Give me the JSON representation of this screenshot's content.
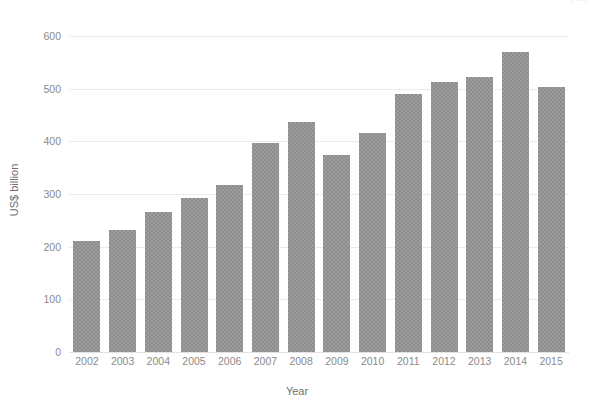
{
  "top_clipped_text": "(%)",
  "chart_data": {
    "type": "bar",
    "title": "",
    "subtitle": "",
    "xlabel": "Year",
    "ylabel": "US$ billion",
    "categories": [
      "2002",
      "2003",
      "2004",
      "2005",
      "2006",
      "2007",
      "2008",
      "2009",
      "2010",
      "2011",
      "2012",
      "2013",
      "2014",
      "2015"
    ],
    "values": [
      210,
      232,
      265,
      293,
      317,
      397,
      436,
      374,
      416,
      489,
      512,
      523,
      570,
      503
    ],
    "series": [
      {
        "name": "US$ billion",
        "values": [
          210,
          232,
          265,
          293,
          317,
          397,
          436,
          374,
          416,
          489,
          512,
          523,
          570,
          503
        ]
      }
    ],
    "ylim": [
      0,
      615
    ],
    "yticks": [
      0,
      100,
      200,
      300,
      400,
      500,
      600
    ],
    "ytick_labels": [
      "0",
      "100",
      "200",
      "300",
      "400",
      "500",
      "600"
    ],
    "xtick_labels": [
      "2002",
      "2003",
      "2004",
      "2005",
      "2006",
      "2007",
      "2008",
      "2009",
      "2010",
      "2011",
      "2012",
      "2013",
      "2014",
      "2015"
    ],
    "grid": "horizontal",
    "legend": "none",
    "bar_color": "#8d8d8d",
    "grid_color": "#ebebeb",
    "text_color": "#8a8a8a",
    "background_color": "#ffffff"
  }
}
